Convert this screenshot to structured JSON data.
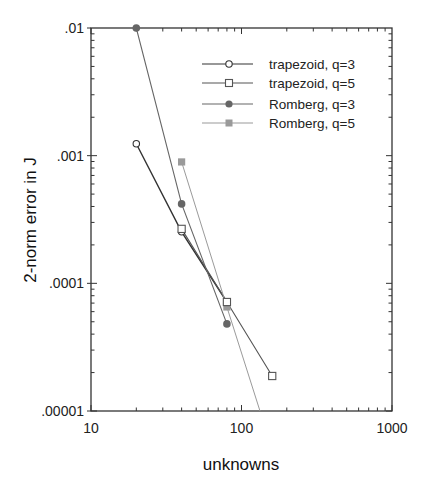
{
  "chart_data": {
    "type": "line",
    "title": "",
    "xlabel": "unknowns",
    "ylabel": "2-norm  error  in  J",
    "xscale": "log",
    "yscale": "log",
    "xlim": [
      10,
      1000
    ],
    "ylim": [
      1e-05,
      0.01
    ],
    "x_ticks": [
      10,
      100,
      1000
    ],
    "x_tick_labels": [
      "10",
      "100",
      "1000"
    ],
    "y_ticks": [
      0.01,
      0.001,
      0.0001,
      1e-05
    ],
    "y_tick_labels": [
      ".01",
      ".001",
      ".0001",
      ".00001"
    ],
    "grid": false,
    "legend_position": "upper right (inside)",
    "series": [
      {
        "name": "trapezoid, q=3",
        "marker": "open-circle",
        "color": "#333333",
        "x": [
          20,
          40,
          80
        ],
        "values": [
          0.00124,
          0.000253,
          7.14e-05
        ]
      },
      {
        "name": "trapezoid, q=5",
        "marker": "open-square",
        "color": "#555555",
        "x": [
          40,
          80,
          160
        ],
        "values": [
          0.000267,
          7.14e-05,
          1.88e-05
        ]
      },
      {
        "name": "Romberg, q=3",
        "marker": "filled-circle",
        "color": "#666666",
        "x": [
          20,
          40,
          80
        ],
        "values": [
          0.01,
          0.000419,
          4.81e-05
        ]
      },
      {
        "name": "Romberg, q=5",
        "marker": "filled-square",
        "color": "#9a9a9a",
        "x": [
          40,
          80,
          160
        ],
        "values": [
          0.000893,
          6.53e-05,
          5e-06
        ],
        "note": "third point lies below the plotted y-range (line clipped at bottom axis)"
      }
    ]
  },
  "legend": {
    "items": [
      {
        "label": "trapezoid, q=3"
      },
      {
        "label": "trapezoid, q=5"
      },
      {
        "label": "Romberg, q=3"
      },
      {
        "label": "Romberg, q=5"
      }
    ]
  }
}
